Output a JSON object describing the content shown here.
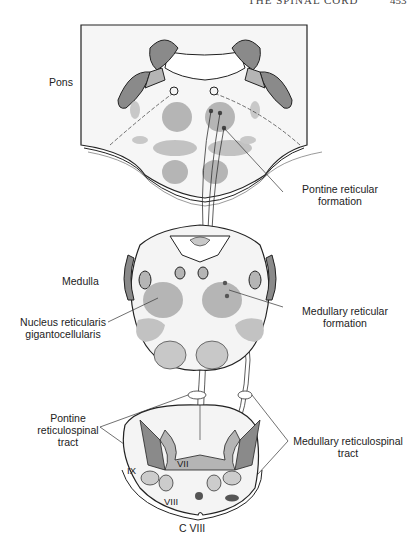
{
  "page_header": {
    "title": "THE SPINAL CORD",
    "page_number": "453"
  },
  "sections": {
    "pons": {
      "label": "Pons"
    },
    "medulla": {
      "label": "Medulla"
    },
    "spinal_level": {
      "label": "C VIII"
    }
  },
  "labels": {
    "pontine_rf": [
      "Pontine reticular",
      "formation"
    ],
    "medullary_rf": [
      "Medullary reticular",
      "formation"
    ],
    "nucleus_gc": [
      "Nucleus reticularis",
      "gigantocellularis"
    ],
    "pontine_rst": [
      "Pontine",
      "reticulospinal",
      "tract"
    ],
    "medullary_rst": [
      "Medullary reticulospinal",
      "tract"
    ],
    "laminae": {
      "vii": "VII",
      "viii": "VIII",
      "ix": "IX"
    }
  },
  "colors": {
    "dark_gray": "#8a8a8a",
    "mid_gray": "#b5b5b5",
    "light_fill": "#f4f4f4",
    "line": "#222222"
  }
}
